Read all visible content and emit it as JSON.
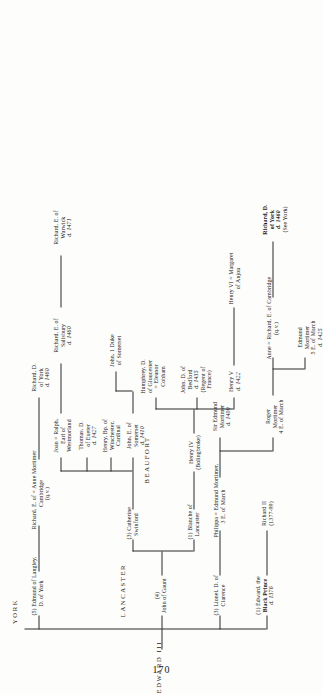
{
  "page": {
    "number": "170",
    "root": "EDWARD III",
    "house_labels": {
      "lancaster": "LANCASTER",
      "york": "YORK",
      "beaufort": "BEAUFORT"
    }
  },
  "nodes": {
    "edward_iii": {
      "lines": [
        "EDWARD III"
      ]
    },
    "lancaster_label": {
      "lines": [
        "LANCASTER"
      ]
    },
    "york_label": {
      "lines": [
        "YORK"
      ]
    },
    "beaufort_label": {
      "lines": [
        "BEAUFORT"
      ]
    },
    "black_prince": {
      "lines": [
        "(1) Edward, the",
        "Black Prince",
        "d. 1376"
      ]
    },
    "richard_ii": {
      "lines": [
        "Richard II",
        "(1377-99)"
      ]
    },
    "lionel": {
      "lines": [
        "(3) Lionel, D. of",
        "Clarence"
      ]
    },
    "philippa": {
      "lines": [
        "Philippa = Edmund Mortimer,",
        "3 E. of March"
      ]
    },
    "sir_edmund": {
      "lines": [
        "Sir Edmund",
        "Mortimer",
        "d. 1409"
      ]
    },
    "roger_mortimer": {
      "lines": [
        "Roger",
        "Mortimer",
        "4 E. of March"
      ]
    },
    "anne_richard": {
      "lines": [
        "Anne = Richard, E. of Cambridge",
        "(q.v.)"
      ]
    },
    "edmund_mortimer5": {
      "lines": [
        "Edmund",
        "Mortimer",
        "5 E. of March",
        "d. 1425"
      ]
    },
    "richard_d_york_seeyork": {
      "lines": [
        "Richard, D.",
        "of York",
        "d. 1460",
        "(See York)"
      ]
    },
    "john_of_gaunt": {
      "lines": [
        "(4)",
        "John of Gaunt"
      ]
    },
    "blanche": {
      "lines": [
        "(1) Blanche of",
        "Lancaster"
      ]
    },
    "catherine": {
      "lines": [
        "(3) Catherine",
        "Swinford"
      ]
    },
    "henry_iv": {
      "lines": [
        "Henry IV",
        "(Bolingbroke)"
      ]
    },
    "henry_v": {
      "lines": [
        "Henry V",
        "d. 1422"
      ]
    },
    "john_bedford": {
      "lines": [
        "John, D. of",
        "Bedford",
        "d. 1435",
        "(Regent of",
        "France)"
      ]
    },
    "humphrey": {
      "lines": [
        "Humphrey, D.",
        "of Gloucester",
        "= Eleanor",
        "Cobham"
      ]
    },
    "henry_vi": {
      "lines": [
        "Henry VI = Margaret",
        "of Anjou"
      ]
    },
    "john_somerset": {
      "lines": [
        "John, E. of",
        "Somerset",
        "d. 1410"
      ]
    },
    "henry_winchester": {
      "lines": [
        "Henry, Bp. of",
        "Winchester,",
        "Cardinal"
      ]
    },
    "thomas_exeter": {
      "lines": [
        "Thomas, D.",
        "of Exeter",
        "d. 1427"
      ]
    },
    "joan_ralph": {
      "lines": [
        "Joan = Ralph,",
        "Earl of",
        "Westmorland"
      ]
    },
    "john_duke_somerset": {
      "lines": [
        "John, 1 Duke",
        "of Somerset"
      ]
    },
    "richard_salisbury": {
      "lines": [
        "Richard, E. of",
        "Salisbury",
        "d. 1460"
      ]
    },
    "richard_warwick": {
      "lines": [
        "Richard, E. of",
        "Warwick",
        "d. 1471"
      ]
    },
    "edmund_langley": {
      "lines": [
        "(5) Edmund of Langley,",
        "D. of York"
      ]
    },
    "richard_cambridge": {
      "lines": [
        "Richard, E. of = Anne Mortimer",
        "Cambridge",
        "(q.v.)"
      ]
    },
    "richard_d_york": {
      "lines": [
        "Richard, D.",
        "of York",
        "d. 1460"
      ]
    }
  }
}
